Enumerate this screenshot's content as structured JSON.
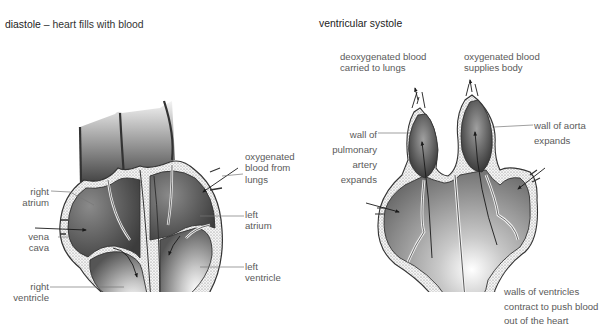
{
  "diastole": {
    "title_term": "diastole",
    "title_rest": " – heart fills with blood",
    "labels": {
      "right_atrium": [
        "right",
        "atrium"
      ],
      "vena_cava": [
        "vena",
        "cava"
      ],
      "right_ventricle": [
        "right",
        "ventricle"
      ],
      "oxygenated_blood_from_lungs": [
        "oxygenated",
        "blood from",
        "lungs"
      ],
      "left_atrium": [
        "left",
        "atrium"
      ],
      "left_ventricle": [
        "left",
        "ventricle"
      ]
    }
  },
  "systole": {
    "title": "ventricular systole",
    "labels": {
      "deoxygenated": [
        "deoxygenated blood",
        "carried to lungs"
      ],
      "oxygenated": [
        "oxygenated blood",
        "supplies body"
      ],
      "pulmonary_artery": [
        "wall of",
        "pulmonary",
        "artery",
        "expands"
      ],
      "aorta": [
        "wall of aorta",
        "expands"
      ],
      "ventricle_walls": [
        "walls of ventricles",
        "contract to push blood",
        "out of the heart"
      ]
    }
  },
  "colors": {
    "chamber_dark": "#4a4a4a",
    "chamber_light": "#e0e0e0",
    "wall_fill": "#f2f2f2",
    "wall_stroke": "#333333",
    "leader_line": "#777777",
    "text": "#5a5a5a"
  }
}
